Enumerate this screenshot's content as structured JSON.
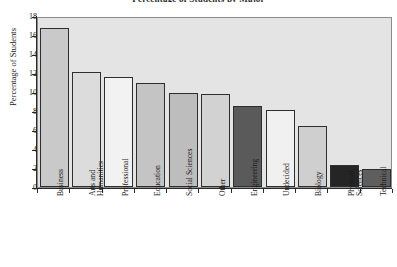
{
  "chart_data": {
    "type": "bar",
    "title": "Percentage of Students by Major",
    "xlabel": "",
    "ylabel": "Percentage of Students",
    "ylim": [
      0,
      18
    ],
    "ytick_labels": [
      "0",
      "2",
      "4",
      "6",
      "8",
      "10",
      "12",
      "14",
      "16",
      "18"
    ],
    "ytick_values": [
      0,
      2,
      4,
      6,
      8,
      10,
      12,
      14,
      16,
      18
    ],
    "grid": false,
    "legend": "none",
    "categories": [
      "Business",
      "Arts and\nHumanities",
      "Professional",
      "Education",
      "Social Sciences",
      "Other",
      "Engineering",
      "Undecided",
      "Biology",
      "Physical\nSciences",
      "Technical"
    ],
    "values": [
      16.7,
      12.1,
      11.6,
      10.9,
      9.9,
      9.8,
      8.5,
      8.1,
      6.4,
      2.35,
      1.9
    ],
    "bar_colors": [
      "#c9c9c9",
      "#dcdcdc",
      "#f2f2f2",
      "#c4c4c4",
      "#bdbdbd",
      "#d2d2d2",
      "#5a5a5a",
      "#f0f0f0",
      "#cfcfcf",
      "#252525",
      "#5e5e5e"
    ],
    "plot_background": "#e4e4e4",
    "axis_color": "#2a2a2a",
    "bar_edge_color": "#2e2e2e"
  }
}
